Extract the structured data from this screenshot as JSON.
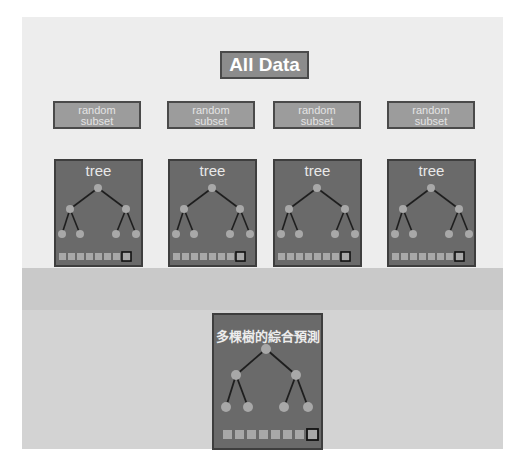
{
  "diagram": {
    "title": "All Data",
    "subsets": [
      {
        "label_line1": "random",
        "label_line2": "subset"
      },
      {
        "label_line1": "random",
        "label_line2": "subset"
      },
      {
        "label_line1": "random",
        "label_line2": "subset"
      },
      {
        "label_line1": "random",
        "label_line2": "subset"
      }
    ],
    "trees": [
      {
        "label": "tree"
      },
      {
        "label": "tree"
      },
      {
        "label": "tree"
      },
      {
        "label": "tree"
      }
    ],
    "ensemble": {
      "label": "多棵樹的綜合預測"
    },
    "colors": {
      "card": "#6a6a6a",
      "node": "#a8a8a8",
      "edge": "#1e1e1e",
      "subset": "#9c9c9c",
      "title": "#8c8c8c"
    }
  }
}
